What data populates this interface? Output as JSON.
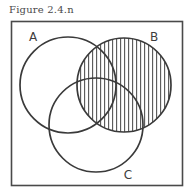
{
  "figure": {
    "caption": "Figure 2.4.n",
    "background_color": "#ffffff",
    "border_color": "#4a4a4a",
    "stroke_color": "#3a3a3a",
    "hatch_color": "#555555"
  },
  "frame": {
    "x": 11,
    "y": 21,
    "width": 171,
    "height": 164
  },
  "chart_data": {
    "type": "venn",
    "title": "Figure 2.4.n",
    "sets": [
      {
        "name": "A",
        "label": "A",
        "cx": 68,
        "cy": 85,
        "r": 48,
        "shaded": false
      },
      {
        "name": "B",
        "label": "B",
        "cx": 124,
        "cy": 85,
        "r": 47,
        "shaded": true
      },
      {
        "name": "C",
        "label": "C",
        "cx": 96,
        "cy": 125,
        "r": 47,
        "shaded": false
      }
    ],
    "shaded_region": "B",
    "shading_style": "vertical-hatch",
    "hatch_spacing_px": 4,
    "labels": [
      {
        "text": "A",
        "x": 33,
        "y": 41
      },
      {
        "text": "B",
        "x": 154,
        "y": 41
      },
      {
        "text": "C",
        "x": 128,
        "y": 179
      }
    ],
    "legend": null,
    "grid": false
  },
  "set_a": {
    "label": "A"
  },
  "set_b": {
    "label": "B"
  },
  "set_c": {
    "label": "C"
  }
}
